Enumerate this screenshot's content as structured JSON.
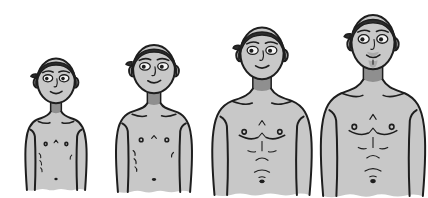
{
  "illustration": {
    "title": "Four stages of male growth from boyhood to adulthood",
    "style": "grayscale cartoon illustration, bare-chested figures cut off at the waist",
    "background_color": "#ffffff",
    "palette": {
      "skin": "#c8c8c8",
      "hair": "#2d2d2d",
      "outline": "#1e1e1e",
      "neck_shade": "#8f8f8f",
      "eye_white": "#f4f4f4",
      "stubble": "#9b9b9b"
    },
    "figures": [
      {
        "id": "stage-1",
        "label": "young boy, smallest figure, slim torso with rib lines",
        "build": "slim",
        "relative_height": 1
      },
      {
        "id": "stage-2",
        "label": "older boy, slightly taller, slim torso",
        "build": "slim",
        "relative_height": 2
      },
      {
        "id": "stage-3",
        "label": "adolescent, broader shoulders and defined chest",
        "build": "muscular",
        "relative_height": 3
      },
      {
        "id": "stage-4",
        "label": "adult man, tallest, muscular chest and facial stubble",
        "build": "muscular",
        "relative_height": 4
      }
    ]
  }
}
